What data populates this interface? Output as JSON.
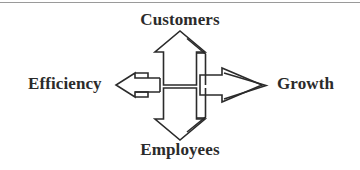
{
  "figure": {
    "background_color": "#ffffff",
    "stroke_color": "#2b2b2b",
    "rule_color": "#9a9a9a",
    "labels": {
      "top": "Customers",
      "bottom": "Employees",
      "left": "Efficiency",
      "right": "Growth"
    },
    "arrows": [
      {
        "name": "up-arrow",
        "direction": "up",
        "points_to": "Customers"
      },
      {
        "name": "down-arrow",
        "direction": "down",
        "points_to": "Employees"
      },
      {
        "name": "left-arrow",
        "direction": "left",
        "points_to": "Efficiency"
      },
      {
        "name": "right-arrow",
        "direction": "right",
        "points_to": "Growth"
      }
    ]
  }
}
